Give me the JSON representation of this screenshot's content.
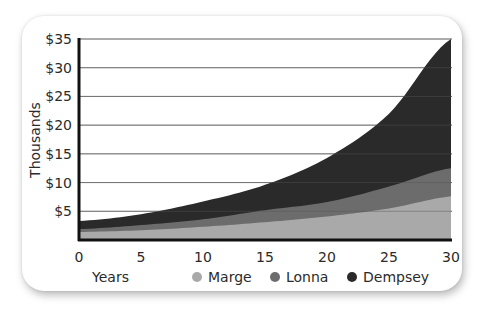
{
  "chart_data": {
    "type": "area",
    "stacked": true,
    "title": "",
    "xlabel": "Years",
    "ylabel": "Thousands",
    "x": [
      0,
      5,
      10,
      15,
      20,
      25,
      30
    ],
    "xticks": [
      "0",
      "5",
      "10",
      "15",
      "20",
      "25",
      "30"
    ],
    "yticks": [
      "$5",
      "$10",
      "$15",
      "$20",
      "$25",
      "$30",
      "$35"
    ],
    "ylim": [
      0,
      35
    ],
    "xlim": [
      0,
      30
    ],
    "grid": true,
    "legend_position": "bottom",
    "series": [
      {
        "name": "Marge",
        "color": "#a9a9a9",
        "values": [
          1.4,
          1.7,
          2.3,
          3.1,
          4.1,
          5.5,
          7.6
        ]
      },
      {
        "name": "Lonna",
        "color": "#6c6c6c",
        "values": [
          0.5,
          0.9,
          1.3,
          2.1,
          2.5,
          3.8,
          4.9
        ]
      },
      {
        "name": "Dempsey",
        "color": "#2a2a2a",
        "values": [
          1.4,
          1.9,
          3.1,
          4.4,
          7.7,
          12.7,
          22.5
        ]
      }
    ],
    "cumulative_totals": [
      3.3,
      4.5,
      6.7,
      9.6,
      14.3,
      22.0,
      35.0
    ]
  },
  "axis": {
    "y_title": "Thousands",
    "x_title": "Years"
  },
  "legend": {
    "items": [
      {
        "label": "Marge",
        "color": "#a9a9a9"
      },
      {
        "label": "Lonna",
        "color": "#6c6c6c"
      },
      {
        "label": "Dempsey",
        "color": "#2a2a2a"
      }
    ]
  }
}
